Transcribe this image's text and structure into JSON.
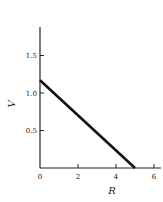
{
  "chart_data": {
    "type": "line",
    "title": "",
    "xlabel": "R",
    "ylabel": "V",
    "xlim": [
      0,
      6.2
    ],
    "ylim": [
      0,
      1.85
    ],
    "grid": false,
    "legend": null,
    "x_ticks": [
      {
        "value": 0,
        "label": "0"
      },
      {
        "value": 2,
        "label": "2"
      },
      {
        "value": 4,
        "label": "4"
      },
      {
        "value": 6,
        "label": "6"
      }
    ],
    "y_ticks": [
      {
        "value": 0.5,
        "label": "0.5"
      },
      {
        "value": 1.0,
        "label": "1.0"
      },
      {
        "value": 1.5,
        "label": "1.5"
      }
    ],
    "series": [
      {
        "name": "V vs R",
        "x": [
          0,
          5.0
        ],
        "y": [
          1.17,
          0
        ],
        "color": "#111111"
      }
    ]
  },
  "colors": {
    "line": "#111111",
    "axis": "#222222",
    "background": "#ffffff"
  }
}
